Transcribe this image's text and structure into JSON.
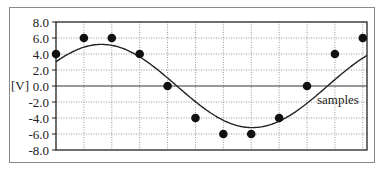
{
  "chart_data": {
    "type": "scatter",
    "title": "",
    "xlabel": "samples",
    "ylabel": "[V]",
    "ylim": [
      -8.0,
      8.0
    ],
    "yticks": [
      "8.0",
      "6.0",
      "4.0",
      "2.0",
      "0.0",
      "-2.0",
      "-4.0",
      "-6.0",
      "-8.0"
    ],
    "grid": true,
    "legend": null,
    "series": [
      {
        "name": "samples",
        "style": "markers",
        "x": [
          0,
          1,
          2,
          3,
          4,
          5,
          6,
          7,
          8,
          9,
          10,
          11
        ],
        "values": [
          4.0,
          6.0,
          6.0,
          4.0,
          0.0,
          -4.0,
          -6.0,
          -6.0,
          -4.0,
          0.0,
          4.0,
          6.0
        ]
      },
      {
        "name": "sine",
        "style": "line",
        "description": "continuous sinusoid, amplitude ~5.2 V, period ~10.8 samples",
        "x": [
          0,
          1,
          2,
          3,
          4,
          5,
          6,
          7,
          8,
          9,
          10,
          11
        ],
        "values": [
          3.0,
          4.8,
          5.1,
          3.8,
          1.0,
          -2.2,
          -4.6,
          -5.1,
          -3.9,
          -1.2,
          2.2,
          4.9
        ]
      }
    ]
  },
  "axis": {
    "ylabel": "[V]",
    "xlabel": "samples"
  }
}
